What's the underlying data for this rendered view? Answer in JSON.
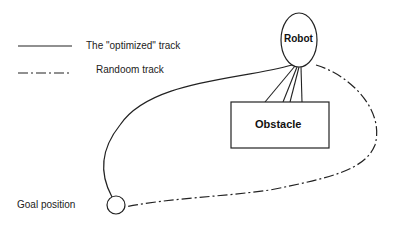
{
  "legend": {
    "items": [
      {
        "label": "The \"optimized\" track",
        "style": "solid"
      },
      {
        "label": "Randoom track",
        "style": "dash-dot"
      }
    ]
  },
  "nodes": {
    "robot": {
      "label": "Robot"
    },
    "obstacle": {
      "label": "Obstacle"
    },
    "goal": {
      "label": "Goal position"
    }
  },
  "colors": {
    "stroke": "#222222",
    "background": "#ffffff"
  }
}
